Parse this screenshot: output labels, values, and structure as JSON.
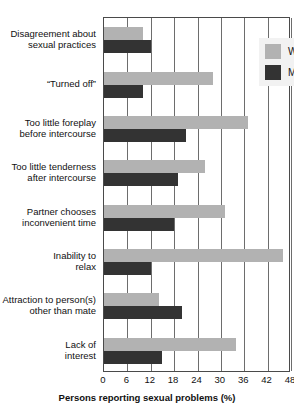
{
  "chart_data": {
    "type": "bar",
    "orientation": "horizontal",
    "title": "",
    "xlabel": "Persons reporting sexual problems (%)",
    "ylabel": "",
    "xlim": [
      0,
      48
    ],
    "xticks": [
      0,
      6,
      12,
      18,
      24,
      30,
      36,
      42,
      48
    ],
    "grid": true,
    "legend_position": "top-right",
    "categories": [
      "Disagreement about sexual practices",
      "“Turned off”",
      "Too little foreplay before intercourse",
      "Too little tenderness after intercourse",
      "Partner chooses inconvenient time",
      "Inability to relax",
      "Attraction to person(s) other than mate",
      "Lack of interest"
    ],
    "category_lines": [
      [
        "Disagreement about",
        "sexual practices"
      ],
      [
        "“Turned off”"
      ],
      [
        "Too little foreplay",
        "before intercourse"
      ],
      [
        "Too little tenderness",
        "after intercourse"
      ],
      [
        "Partner chooses",
        "inconvenient time"
      ],
      [
        "Inability to",
        "relax"
      ],
      [
        "Attraction to person(s)",
        "other than mate"
      ],
      [
        "Lack of",
        "interest"
      ]
    ],
    "series": [
      {
        "name": "Women",
        "color": "#b2b2b2",
        "values": [
          10,
          28,
          37,
          26,
          31,
          46,
          14,
          34
        ]
      },
      {
        "name": "Men",
        "color": "#333333",
        "values": [
          12,
          10,
          21,
          19,
          18,
          12,
          20,
          15
        ]
      }
    ]
  },
  "legend": {
    "items": [
      {
        "label": "Women",
        "color": "#b2b2b2"
      },
      {
        "label": "Men",
        "color": "#333333"
      }
    ]
  }
}
